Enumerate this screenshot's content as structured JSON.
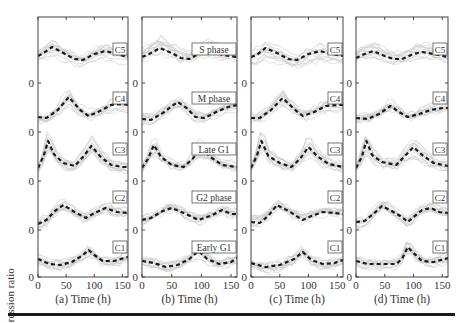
{
  "chart_data": {
    "type": "line",
    "title": "",
    "ylabel": "Expression ratio",
    "xlabel_suffix": "Time (h)",
    "x_ticks": [
      0,
      50,
      100,
      150
    ],
    "xlim": [
      0,
      160
    ],
    "y_zero_label": "0",
    "grid": false,
    "note": "Each panel shows 5 stacked clusters (C1 bottom ... C5 top); grey lines are individual gene profiles, dashed black line is cluster mean. Offsets are relative units (positive = above the cluster's zero line).",
    "panels": [
      {
        "id": "a",
        "xlabel": "(a) Time (h)",
        "labels": [
          "C5",
          "C4",
          "C3",
          "C2",
          "C1"
        ],
        "clusters": [
          {
            "name": "C5",
            "mean": [
              [
                0,
                27
              ],
              [
                10,
                30
              ],
              [
                25,
                36
              ],
              [
                45,
                30
              ],
              [
                65,
                24
              ],
              [
                80,
                23
              ],
              [
                100,
                29
              ],
              [
                120,
                32
              ],
              [
                140,
                29
              ],
              [
                160,
                26
              ]
            ]
          },
          {
            "name": "C4",
            "mean": [
              [
                0,
                15
              ],
              [
                15,
                14
              ],
              [
                35,
                22
              ],
              [
                55,
                35
              ],
              [
                75,
                22
              ],
              [
                90,
                16
              ],
              [
                110,
                21
              ],
              [
                130,
                27
              ],
              [
                150,
                28
              ],
              [
                160,
                27
              ]
            ]
          },
          {
            "name": "C3",
            "mean": [
              [
                0,
                13
              ],
              [
                10,
                25
              ],
              [
                18,
                40
              ],
              [
                28,
                27
              ],
              [
                45,
                18
              ],
              [
                65,
                15
              ],
              [
                80,
                24
              ],
              [
                95,
                35
              ],
              [
                110,
                25
              ],
              [
                130,
                16
              ],
              [
                150,
                14
              ],
              [
                160,
                14
              ]
            ]
          },
          {
            "name": "C2",
            "mean": [
              [
                0,
                6
              ],
              [
                15,
                10
              ],
              [
                30,
                19
              ],
              [
                45,
                25
              ],
              [
                65,
                18
              ],
              [
                85,
                12
              ],
              [
                100,
                17
              ],
              [
                120,
                22
              ],
              [
                140,
                18
              ],
              [
                160,
                17
              ]
            ]
          },
          {
            "name": "C1",
            "mean": [
              [
                0,
                18
              ],
              [
                20,
                13
              ],
              [
                40,
                12
              ],
              [
                60,
                15
              ],
              [
                80,
                22
              ],
              [
                90,
                27
              ],
              [
                100,
                22
              ],
              [
                115,
                16
              ],
              [
                135,
                16
              ],
              [
                160,
                20
              ]
            ]
          }
        ]
      },
      {
        "id": "b",
        "xlabel": "(b) Time (h)",
        "labels": [
          "S phase",
          "M phase",
          "Late G1",
          "G2 phase",
          "Early G1"
        ],
        "clusters": [
          {
            "name": "S phase",
            "mean": [
              [
                0,
                26
              ],
              [
                12,
                29
              ],
              [
                30,
                35
              ],
              [
                50,
                30
              ],
              [
                65,
                25
              ],
              [
                80,
                24
              ],
              [
                100,
                31
              ],
              [
                115,
                33
              ],
              [
                135,
                28
              ],
              [
                160,
                26
              ]
            ]
          },
          {
            "name": "M phase",
            "mean": [
              [
                0,
                13
              ],
              [
                15,
                12
              ],
              [
                35,
                19
              ],
              [
                60,
                30
              ],
              [
                75,
                24
              ],
              [
                90,
                15
              ],
              [
                105,
                14
              ],
              [
                125,
                20
              ],
              [
                145,
                25
              ],
              [
                160,
                27
              ]
            ]
          },
          {
            "name": "Late G1",
            "mean": [
              [
                0,
                13
              ],
              [
                10,
                22
              ],
              [
                20,
                36
              ],
              [
                32,
                24
              ],
              [
                50,
                16
              ],
              [
                70,
                14
              ],
              [
                85,
                22
              ],
              [
                100,
                33
              ],
              [
                115,
                24
              ],
              [
                135,
                16
              ],
              [
                160,
                14
              ]
            ]
          },
          {
            "name": "G2 phase",
            "mean": [
              [
                0,
                10
              ],
              [
                15,
                12
              ],
              [
                35,
                19
              ],
              [
                50,
                22
              ],
              [
                70,
                17
              ],
              [
                95,
                10
              ],
              [
                115,
                14
              ],
              [
                135,
                20
              ],
              [
                150,
                16
              ],
              [
                160,
                16
              ]
            ]
          },
          {
            "name": "Early G1",
            "mean": [
              [
                0,
                16
              ],
              [
                20,
                14
              ],
              [
                40,
                10
              ],
              [
                60,
                12
              ],
              [
                80,
                18
              ],
              [
                95,
                26
              ],
              [
                110,
                18
              ],
              [
                130,
                13
              ],
              [
                150,
                15
              ],
              [
                160,
                19
              ]
            ]
          }
        ]
      },
      {
        "id": "c",
        "xlabel": "(c) Time (h)",
        "labels": [
          "C5",
          "C4",
          "C3",
          "C2",
          "C1"
        ],
        "clusters": [
          {
            "name": "C5",
            "mean": [
              [
                0,
                26
              ],
              [
                10,
                28
              ],
              [
                25,
                35
              ],
              [
                45,
                30
              ],
              [
                65,
                24
              ],
              [
                80,
                23
              ],
              [
                100,
                29
              ],
              [
                120,
                32
              ],
              [
                140,
                29
              ],
              [
                160,
                27
              ]
            ]
          },
          {
            "name": "C4",
            "mean": [
              [
                0,
                14
              ],
              [
                15,
                14
              ],
              [
                35,
                22
              ],
              [
                55,
                34
              ],
              [
                75,
                23
              ],
              [
                90,
                16
              ],
              [
                110,
                20
              ],
              [
                130,
                26
              ],
              [
                150,
                27
              ],
              [
                160,
                27
              ]
            ]
          },
          {
            "name": "C3",
            "mean": [
              [
                0,
                13
              ],
              [
                10,
                25
              ],
              [
                18,
                40
              ],
              [
                30,
                25
              ],
              [
                50,
                18
              ],
              [
                70,
                14
              ],
              [
                85,
                22
              ],
              [
                100,
                34
              ],
              [
                115,
                25
              ],
              [
                135,
                17
              ],
              [
                160,
                14
              ]
            ]
          },
          {
            "name": "C2",
            "mean": [
              [
                0,
                8
              ],
              [
                15,
                7
              ],
              [
                30,
                14
              ],
              [
                45,
                25
              ],
              [
                65,
                19
              ],
              [
                90,
                10
              ],
              [
                105,
                14
              ],
              [
                125,
                18
              ],
              [
                145,
                17
              ],
              [
                160,
                16
              ]
            ]
          },
          {
            "name": "C1",
            "mean": [
              [
                0,
                14
              ],
              [
                25,
                10
              ],
              [
                50,
                12
              ],
              [
                75,
                18
              ],
              [
                90,
                25
              ],
              [
                105,
                17
              ],
              [
                125,
                13
              ],
              [
                145,
                14
              ],
              [
                160,
                17
              ]
            ]
          }
        ]
      },
      {
        "id": "d",
        "xlabel": "(d) Time (h)",
        "labels": [
          "C5",
          "C4",
          "C3",
          "C2",
          "C1"
        ],
        "clusters": [
          {
            "name": "C5",
            "mean": [
              [
                0,
                25
              ],
              [
                10,
                28
              ],
              [
                30,
                32
              ],
              [
                50,
                27
              ],
              [
                65,
                24
              ],
              [
                80,
                24
              ],
              [
                100,
                29
              ],
              [
                115,
                31
              ],
              [
                135,
                29
              ],
              [
                160,
                26
              ]
            ]
          },
          {
            "name": "C4",
            "mean": [
              [
                0,
                14
              ],
              [
                20,
                13
              ],
              [
                40,
                18
              ],
              [
                60,
                26
              ],
              [
                75,
                20
              ],
              [
                90,
                15
              ],
              [
                110,
                18
              ],
              [
                130,
                22
              ],
              [
                150,
                24
              ],
              [
                160,
                24
              ]
            ]
          },
          {
            "name": "C3",
            "mean": [
              [
                0,
                13
              ],
              [
                10,
                24
              ],
              [
                18,
                40
              ],
              [
                28,
                26
              ],
              [
                45,
                19
              ],
              [
                70,
                16
              ],
              [
                85,
                25
              ],
              [
                100,
                34
              ],
              [
                115,
                26
              ],
              [
                135,
                18
              ],
              [
                160,
                15
              ]
            ]
          },
          {
            "name": "C2",
            "mean": [
              [
                0,
                8
              ],
              [
                15,
                9
              ],
              [
                30,
                16
              ],
              [
                45,
                24
              ],
              [
                65,
                18
              ],
              [
                80,
                13
              ],
              [
                90,
                8
              ],
              [
                100,
                13
              ],
              [
                115,
                20
              ],
              [
                130,
                22
              ],
              [
                145,
                18
              ],
              [
                160,
                17
              ]
            ]
          },
          {
            "name": "C1",
            "mean": [
              [
                0,
                16
              ],
              [
                20,
                13
              ],
              [
                40,
                13
              ],
              [
                70,
                13
              ],
              [
                80,
                18
              ],
              [
                90,
                30
              ],
              [
                100,
                24
              ],
              [
                115,
                16
              ],
              [
                135,
                15
              ],
              [
                160,
                19
              ]
            ]
          }
        ]
      }
    ]
  },
  "layout": {
    "plot_top": 17,
    "plot_bottom": 277,
    "zero_lines_y": [
      83,
      132,
      181,
      230,
      277
    ],
    "label_box_y": [
      43,
      92,
      143,
      191,
      241
    ],
    "panels_x": [
      [
        38,
        128
      ],
      [
        142,
        237
      ],
      [
        251,
        343
      ],
      [
        356,
        448
      ]
    ],
    "colors": {
      "mean": "#1a1a1a",
      "genes": "#c8c8c8",
      "axis": "#444444",
      "text": "#333333"
    }
  }
}
